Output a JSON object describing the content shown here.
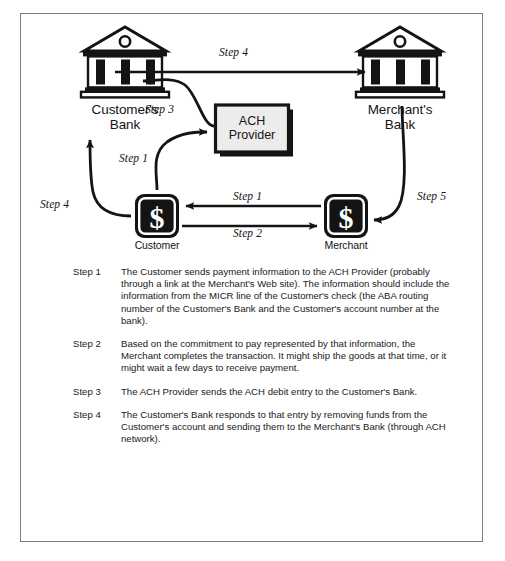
{
  "diagram": {
    "nodes": [
      {
        "id": "customers-bank",
        "label": "Customer's\nBank",
        "type": "bank-icon"
      },
      {
        "id": "merchants-bank",
        "label": "Merchant's\nBank",
        "type": "bank-icon"
      },
      {
        "id": "ach-provider",
        "label": "ACH\nProvider",
        "type": "box"
      },
      {
        "id": "customer",
        "label": "Customer",
        "type": "dollar-icon"
      },
      {
        "id": "merchant",
        "label": "Merchant",
        "type": "dollar-icon"
      }
    ],
    "arrows": [
      {
        "id": "arrow-step4-top",
        "label": "Step 4",
        "from": "customers-bank",
        "to": "merchants-bank"
      },
      {
        "id": "arrow-step3",
        "label": "Step 3",
        "from": "ach-provider",
        "to": "customers-bank"
      },
      {
        "id": "arrow-step1-to-ach",
        "label": "Step 1",
        "from": "customer",
        "to": "ach-provider"
      },
      {
        "id": "arrow-step4-left",
        "label": "Step 4",
        "from": "customer",
        "to": "customers-bank"
      },
      {
        "id": "arrow-step1-mid",
        "label": "Step 1",
        "from": "merchant",
        "to": "customer"
      },
      {
        "id": "arrow-step2-mid",
        "label": "Step 2",
        "from": "customer",
        "to": "merchant"
      },
      {
        "id": "arrow-step5",
        "label": "Step 5",
        "from": "merchants-bank",
        "to": "merchant"
      }
    ],
    "colors": {
      "frame_border": "#7d7d7d",
      "stroke": "#141414",
      "box_fill": "#ececec",
      "icon_fill": "#141414",
      "background": "#ffffff"
    }
  },
  "steps": [
    {
      "key": "Step 1",
      "text": "The Customer sends payment information to the ACH Provider (probably through a link at the Merchant's Web site).  The information should include the information from the MICR line of the Customer's check (the ABA routing number of the Customer's Bank and the Customer's account number at the bank)."
    },
    {
      "key": "Step 2",
      "text": "Based on the commitment to pay represented by that information, the Merchant completes the transaction.  It might ship the goods at that time, or it might wait a few days to receive payment."
    },
    {
      "key": "Step 3",
      "text": "The ACH Provider sends the ACH debit entry to the Customer's Bank."
    },
    {
      "key": "Step 4",
      "text": "The Customer's Bank responds to that entry by removing funds from the Customer's account and sending them to the Merchant's Bank (through ACH network)."
    }
  ]
}
